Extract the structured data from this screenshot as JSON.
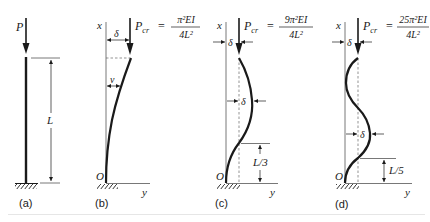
{
  "figure": {
    "panels": [
      {
        "id": "a",
        "label": "(a)",
        "load_label": "P",
        "length_label": "L"
      },
      {
        "id": "b",
        "label": "(b)",
        "axis_x": "x",
        "axis_y": "y",
        "origin": "O",
        "load_lhs": "P",
        "load_sub": "cr",
        "eq": "=",
        "numerator": "π²EI",
        "denominator": "4L²",
        "delta": "δ",
        "deflection": "v"
      },
      {
        "id": "c",
        "label": "(c)",
        "axis_x": "x",
        "axis_y": "y",
        "origin": "O",
        "load_lhs": "P",
        "load_sub": "cr",
        "eq": "=",
        "numerator": "9π²EI",
        "denominator": "4L²",
        "delta_top": "δ",
        "delta_mid": "δ",
        "segment_label": "L/3"
      },
      {
        "id": "d",
        "label": "(d)",
        "axis_x": "x",
        "axis_y": "y",
        "origin": "O",
        "load_lhs": "P",
        "load_sub": "cr",
        "eq": "=",
        "numerator": "25π²EI",
        "denominator": "4L²",
        "delta_top": "δ",
        "delta_mid": "δ",
        "segment_label": "L/5"
      }
    ],
    "colors": {
      "ink": "#1a1a1a",
      "axis": "#555555",
      "dash": "#666666",
      "separator": "#e6e6e6"
    }
  }
}
